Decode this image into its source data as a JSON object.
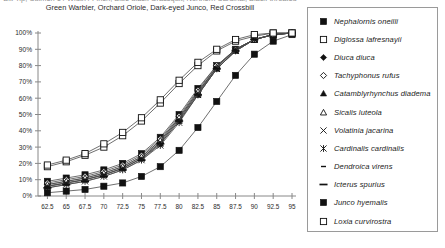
{
  "title": {
    "line1": "Bill Tip, Culmen 1 / Width / Finch, Blue-black Grassquit, Northern Cardinal, Black-throated",
    "line2": "Green Warbler, Orchard Oriole, Dark-eyed Junco, Red Crossbill"
  },
  "legend": {
    "items": [
      {
        "label": "Nephalornis oneilli",
        "marker": "filled-square"
      },
      {
        "label": "Diglossa lafresnayii",
        "marker": "open-square"
      },
      {
        "label": "Diuca diuca",
        "marker": "filled-diamond"
      },
      {
        "label": "Tachyphonus rufus",
        "marker": "open-diamond"
      },
      {
        "label": "Catamblyrhynchus diadema",
        "marker": "filled-triangle"
      },
      {
        "label": "Sicalis luteola",
        "marker": "open-triangle"
      },
      {
        "label": "Volatinia jacarina",
        "marker": "cross-x"
      },
      {
        "label": "Cardinalis cardinalis",
        "marker": "asterisk"
      },
      {
        "label": "Dendroica virens",
        "marker": "short-dash"
      },
      {
        "label": "Icterus spurius",
        "marker": "long-dash"
      },
      {
        "label": "Junco hyemalis",
        "marker": "filled-square"
      },
      {
        "label": "Loxia curvirostra",
        "marker": "open-square"
      }
    ]
  },
  "chart_data": {
    "type": "line",
    "title": "Bill Tip, Culmen 1 / Width / Finch, Blue-black Grassquit, Northern Cardinal, Black-throated Green Warbler, Orchard Oriole, Dark-eyed Junco, Red Crossbill",
    "xlabel": "",
    "ylabel": "",
    "xlim": [
      61.25,
      95
    ],
    "ylim": [
      0,
      100
    ],
    "grid": false,
    "legend_position": "right",
    "x_tick_labels": [
      "62.5",
      "65",
      "67.5",
      "70",
      "72.5",
      "75",
      "77.5",
      "80",
      "82.5",
      "85",
      "87.5",
      "90",
      "92.5",
      "95"
    ],
    "x_tick_values": [
      62.5,
      65,
      67.5,
      70,
      72.5,
      75,
      77.5,
      80,
      82.5,
      85,
      87.5,
      90,
      92.5,
      95
    ],
    "y_tick_labels": [
      "0%",
      "10%",
      "20%",
      "30%",
      "40%",
      "50%",
      "60%",
      "70%",
      "80%",
      "90%",
      "100%"
    ],
    "y_tick_values": [
      0,
      10,
      20,
      30,
      40,
      50,
      60,
      70,
      80,
      90,
      100
    ],
    "x": [
      62.5,
      65,
      67.5,
      70,
      72.5,
      75,
      77.5,
      80,
      82.5,
      85,
      87.5,
      90,
      92.5,
      95
    ],
    "series": [
      {
        "name": "Nephalornis oneilli",
        "marker": "filled-square",
        "values": [
          9,
          11,
          13,
          16,
          20,
          26,
          36,
          50,
          66,
          80,
          90,
          96,
          99,
          100
        ]
      },
      {
        "name": "Diglossa lafresnayii",
        "marker": "open-square",
        "values": [
          18,
          21,
          25,
          30,
          37,
          46,
          57,
          69,
          80,
          89,
          95,
          98,
          100,
          100
        ]
      },
      {
        "name": "Diuca diuca",
        "marker": "filled-diamond",
        "values": [
          7,
          9,
          11,
          14,
          18,
          24,
          34,
          48,
          64,
          79,
          90,
          96,
          99,
          100
        ]
      },
      {
        "name": "Tachyphonus rufus",
        "marker": "open-diamond",
        "values": [
          8,
          10,
          12,
          15,
          19,
          25,
          35,
          49,
          65,
          80,
          90,
          96,
          99,
          100
        ]
      },
      {
        "name": "Catamblyrhynchus diadema",
        "marker": "filled-triangle",
        "values": [
          6,
          8,
          10,
          13,
          17,
          23,
          32,
          46,
          62,
          78,
          89,
          96,
          99,
          100
        ]
      },
      {
        "name": "Sicalis luteola",
        "marker": "open-triangle",
        "values": [
          7,
          9,
          11,
          14,
          18,
          24,
          34,
          48,
          64,
          79,
          90,
          96,
          99,
          100
        ]
      },
      {
        "name": "Volatinia jacarina",
        "marker": "cross-x",
        "values": [
          6,
          8,
          10,
          13,
          17,
          23,
          33,
          47,
          63,
          78,
          89,
          96,
          99,
          100
        ]
      },
      {
        "name": "Cardinalis cardinalis",
        "marker": "asterisk",
        "values": [
          5,
          7,
          9,
          12,
          16,
          22,
          31,
          45,
          62,
          78,
          89,
          96,
          99,
          100
        ]
      },
      {
        "name": "Dendroica virens",
        "marker": "short-dash",
        "values": [
          6,
          8,
          10,
          13,
          17,
          23,
          33,
          47,
          63,
          79,
          90,
          96,
          99,
          100
        ]
      },
      {
        "name": "Icterus spurius",
        "marker": "long-dash",
        "values": [
          5,
          7,
          9,
          12,
          16,
          22,
          32,
          46,
          62,
          78,
          89,
          96,
          99,
          100
        ]
      },
      {
        "name": "Junco hyemalis",
        "marker": "filled-square",
        "values": [
          2,
          3,
          4,
          6,
          8,
          12,
          18,
          28,
          42,
          58,
          74,
          87,
          95,
          99
        ]
      },
      {
        "name": "Loxia curvirostra",
        "marker": "open-square",
        "values": [
          19,
          22,
          26,
          32,
          39,
          48,
          59,
          71,
          82,
          90,
          96,
          99,
          100,
          100
        ]
      }
    ]
  }
}
